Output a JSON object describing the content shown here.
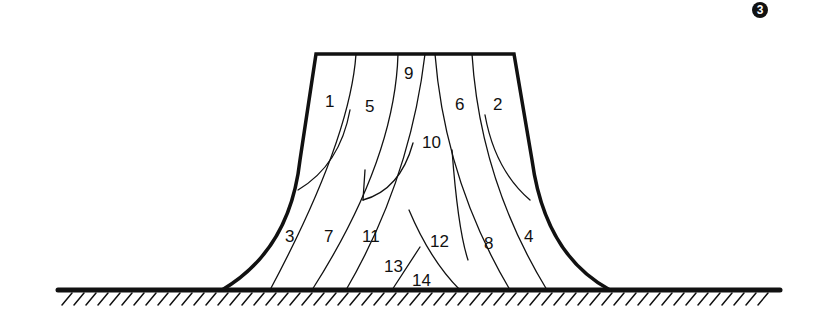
{
  "figure": {
    "number_badge": "3",
    "labels": [
      "1",
      "2",
      "3",
      "4",
      "5",
      "6",
      "7",
      "8",
      "9",
      "10",
      "11",
      "12",
      "13",
      "14"
    ],
    "colors": {
      "line": "#111111",
      "background": "#ffffff"
    }
  }
}
